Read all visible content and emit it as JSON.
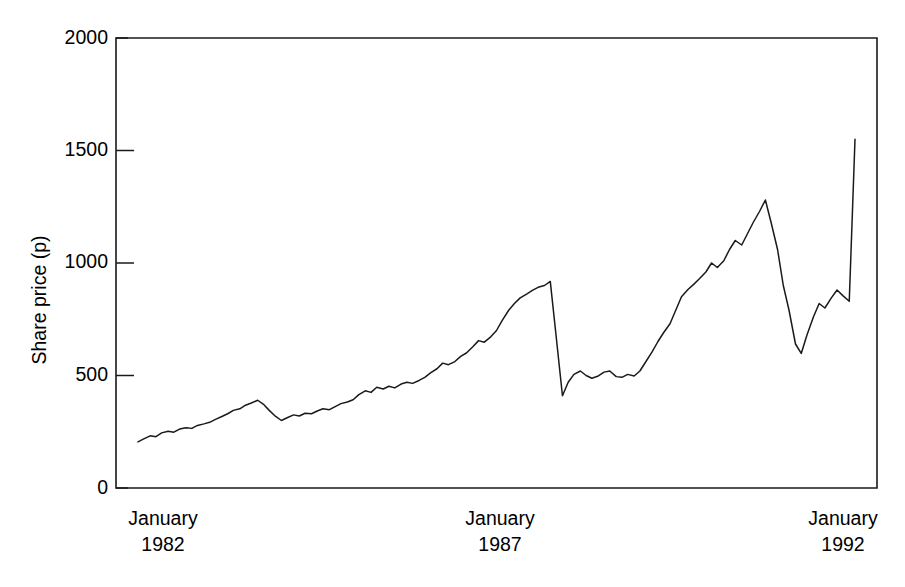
{
  "chart_data": {
    "type": "line",
    "title": "",
    "subtitle": "",
    "xlabel": "",
    "ylabel": "Share price (p)",
    "ylim": [
      0,
      2000
    ],
    "yticks": [
      0,
      500,
      1000,
      1500,
      2000
    ],
    "ytick_labels": [
      "0",
      "500",
      "1000",
      "1500",
      "2000"
    ],
    "xlim": [
      1982.0,
      1992.0
    ],
    "xticks": [
      1982.0,
      1987.0,
      1992.0
    ],
    "xtick_labels": [
      "January\n1982",
      "January\n1987",
      "January\n1992"
    ],
    "xtick_month": "January",
    "xtick_years": [
      "1982",
      "1987",
      "1992"
    ],
    "grid": false,
    "legend": false,
    "legend_position": "none",
    "line_color": "#1a1a1a",
    "background_color": "#ffffff",
    "series": [
      {
        "name": "Share price",
        "units": "p",
        "x": [
          1982.0,
          1982.08,
          1982.17,
          1982.25,
          1982.33,
          1982.42,
          1982.5,
          1982.58,
          1982.67,
          1982.75,
          1982.83,
          1982.92,
          1983.0,
          1983.08,
          1983.17,
          1983.25,
          1983.33,
          1983.42,
          1983.5,
          1983.58,
          1983.67,
          1983.75,
          1983.83,
          1983.92,
          1984.0,
          1984.08,
          1984.17,
          1984.25,
          1984.33,
          1984.42,
          1984.5,
          1984.58,
          1984.67,
          1984.75,
          1984.83,
          1984.92,
          1985.0,
          1985.08,
          1985.17,
          1985.25,
          1985.33,
          1985.42,
          1985.5,
          1985.58,
          1985.67,
          1985.75,
          1985.83,
          1985.92,
          1986.0,
          1986.08,
          1986.17,
          1986.25,
          1986.33,
          1986.42,
          1986.5,
          1986.58,
          1986.67,
          1986.75,
          1986.83,
          1986.92,
          1987.0,
          1987.08,
          1987.17,
          1987.25,
          1987.33,
          1987.42,
          1987.5,
          1987.58,
          1987.67,
          1987.75,
          1987.83,
          1987.92,
          1988.0,
          1988.08,
          1988.17,
          1988.25,
          1988.33,
          1988.42,
          1988.5,
          1988.58,
          1988.67,
          1988.75,
          1988.83,
          1988.92,
          1989.0,
          1989.08,
          1989.17,
          1989.25,
          1989.33,
          1989.42,
          1989.5,
          1989.58,
          1989.67,
          1989.75,
          1989.83,
          1989.92,
          1990.0,
          1990.08,
          1990.17,
          1990.25,
          1990.33,
          1990.42,
          1990.5,
          1990.58,
          1990.67,
          1990.75,
          1990.83,
          1990.92,
          1991.0,
          1991.08,
          1991.17,
          1991.25,
          1991.33,
          1991.42,
          1991.5,
          1991.58,
          1991.67,
          1991.75,
          1991.83,
          1991.92,
          1992.0
        ],
        "values": [
          205,
          218,
          232,
          228,
          245,
          252,
          248,
          262,
          268,
          265,
          278,
          285,
          292,
          305,
          318,
          330,
          345,
          352,
          368,
          378,
          390,
          372,
          345,
          318,
          300,
          312,
          325,
          320,
          332,
          330,
          342,
          352,
          348,
          362,
          375,
          382,
          392,
          415,
          432,
          425,
          448,
          440,
          452,
          445,
          462,
          470,
          465,
          478,
          492,
          512,
          530,
          555,
          548,
          562,
          585,
          600,
          628,
          655,
          648,
          672,
          700,
          745,
          790,
          820,
          845,
          862,
          878,
          892,
          900,
          918,
          680,
          410,
          470,
          505,
          520,
          500,
          488,
          498,
          515,
          520,
          495,
          492,
          505,
          498,
          520,
          560,
          605,
          650,
          690,
          730,
          790,
          850,
          882,
          905,
          930,
          960,
          1000,
          980,
          1010,
          1060,
          1100,
          1080,
          1130,
          1180,
          1230,
          1280,
          1180,
          1060,
          900,
          790,
          640,
          598,
          680,
          760,
          820,
          800,
          845,
          880,
          855,
          830,
          1550
        ]
      }
    ],
    "annotations": [],
    "key_features": [
      {
        "label": "start",
        "x": 1982.0,
        "value": 205
      },
      {
        "label": "pre-crash peak",
        "x": 1987.75,
        "value": 918
      },
      {
        "label": "1987 crash trough",
        "x": 1987.92,
        "value": 410
      },
      {
        "label": "1990 peak",
        "x": 1990.75,
        "value": 1280
      },
      {
        "label": "1990 trough",
        "x": 1991.25,
        "value": 598
      },
      {
        "label": "end",
        "x": 1992.0,
        "value": 1550
      }
    ]
  }
}
